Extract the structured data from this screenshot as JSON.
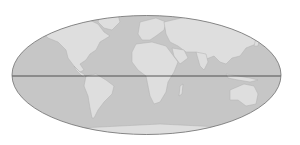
{
  "map": {
    "projection": "Mollweide",
    "colors": {
      "background": "#ffffff",
      "ocean": "#c6c6c6",
      "land": "#dedede",
      "coast": "#b0b0b0",
      "outline": "#6e6e6e",
      "equator": "#333333"
    },
    "features": [
      "world-outline",
      "equator-line",
      "continents"
    ]
  }
}
